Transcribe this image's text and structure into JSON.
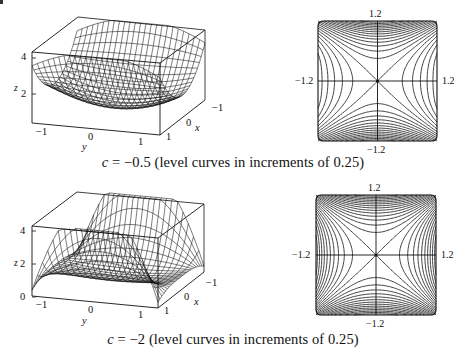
{
  "figure": {
    "panels": [
      {
        "id": "top",
        "c": -0.5,
        "caption": {
          "var": "c",
          "eq": " = ",
          "value": "−0.5",
          "rest": " (level curves in increments of 0.25)"
        },
        "surface": {
          "z_ticks": [
            "4",
            "2"
          ],
          "z_label": "z",
          "y_ticks": [
            "−1",
            "0",
            "1"
          ],
          "y_label": "y",
          "x_ticks": [
            "−1",
            "0",
            "1"
          ],
          "x_label": "x"
        },
        "contour": {
          "top_label": "1.2",
          "bottom_label": "−1.2",
          "left_label": "−1.2",
          "right_label": "1.2",
          "increment": 0.25
        }
      },
      {
        "id": "bottom",
        "c": -2,
        "caption": {
          "var": "c",
          "eq": " = ",
          "value": "−2",
          "rest": " (level curves in increments of 0.25)"
        },
        "surface": {
          "z_ticks": [
            "4",
            "2",
            "0"
          ],
          "z_label": "z",
          "y_ticks": [
            "−1",
            "0",
            "1"
          ],
          "y_label": "y",
          "x_ticks": [
            "−1",
            "0",
            "1"
          ],
          "x_label": "x"
        },
        "contour": {
          "top_label": "1.2",
          "bottom_label": "−1.2",
          "left_label": "−1.2",
          "right_label": "1.2",
          "increment": 0.25
        }
      }
    ]
  },
  "chart_data": [
    {
      "type": "surface",
      "title": "c = −0.5 (level curves in increments of 0.25)",
      "c": -0.5,
      "xlabel": "x",
      "ylabel": "y",
      "zlabel": "z",
      "x_ticks": [
        -1,
        0,
        1
      ],
      "y_ticks": [
        -1,
        0,
        1
      ],
      "z_ticks": [
        2,
        4
      ],
      "xlim": [
        -1.2,
        1.2
      ],
      "ylim": [
        -1.2,
        1.2
      ],
      "zlim": [
        1,
        4.5
      ]
    },
    {
      "type": "contour",
      "title": "c = −0.5 level curves",
      "xlim": [
        -1.2,
        1.2
      ],
      "ylim": [
        -1.2,
        1.2
      ],
      "tick_labels": {
        "top": "1.2",
        "bottom": "−1.2",
        "left": "−1.2",
        "right": "1.2"
      },
      "level_increment": 0.25,
      "features": "saddle at origin; zero-level lines are diagonals; hyperbolas open along ±y, densely packed near y = ±1.2"
    },
    {
      "type": "surface",
      "title": "c = −2 (level curves in increments of 0.25)",
      "c": -2,
      "xlabel": "x",
      "ylabel": "y",
      "zlabel": "z",
      "x_ticks": [
        -1,
        0,
        1
      ],
      "y_ticks": [
        -1,
        0,
        1
      ],
      "z_ticks": [
        0,
        2,
        4
      ],
      "xlim": [
        -1.2,
        1.2
      ],
      "ylim": [
        -1.2,
        1.2
      ],
      "zlim": [
        0,
        4.5
      ]
    },
    {
      "type": "contour",
      "title": "c = −2 level curves",
      "xlim": [
        -1.2,
        1.2
      ],
      "ylim": [
        -1.2,
        1.2
      ],
      "tick_labels": {
        "top": "1.2",
        "bottom": "−1.2",
        "left": "−1.2",
        "right": "1.2"
      },
      "level_increment": 0.25,
      "features": "saddle at origin; hyperbolas open along ±x and ±y; dense near y = ±1.2"
    }
  ]
}
